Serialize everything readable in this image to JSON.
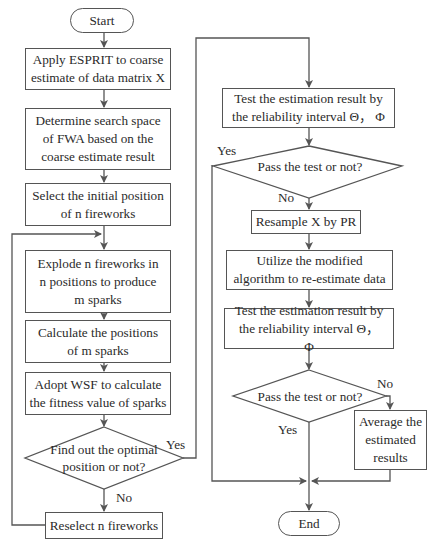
{
  "flowchart": {
    "start": "Start",
    "end": "End",
    "left_column": {
      "step1": "Apply ESPRIT to coarse estimate of  data matrix X",
      "step2": "Determine search space of FWA based on the coarse estimate result",
      "step3": "Select the initial position of n fireworks",
      "step4": "Explode n fireworks in n positions to produce m sparks",
      "step5": "Calculate the positions of m sparks",
      "step6": "Adopt WSF to calculate the fitness value of sparks",
      "decision": "Find out the optimal position or not?",
      "decision_yes": "Yes",
      "decision_no": "No",
      "reselect": "Reselect n fireworks"
    },
    "right_column": {
      "test1": "Test the estimation result by the reliability interval Θ， Φ",
      "decision1": "Pass the test or not?",
      "decision1_yes": "Yes",
      "decision1_no": "No",
      "resample": "Resample X by PR",
      "reestimate": "Utilize the modified algorithm to re-estimate data",
      "test2": "Test the estimation result by the reliability interval Θ， Φ",
      "decision2": "Pass the test or not?",
      "decision2_no": "No",
      "decision2_yes": "Yes",
      "average": "Average the estimated results"
    }
  },
  "colors": {
    "line": "#555555",
    "text": "#2a2a2a",
    "background": "#ffffff"
  }
}
